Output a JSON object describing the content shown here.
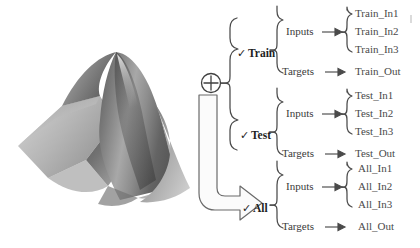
{
  "figure": {
    "caption": "",
    "surface_plot": {
      "name": "peaks-surface-3d",
      "colormap": "grayscale",
      "description": "Shaded 3D peaks surface"
    }
  },
  "combiner": {
    "icon": "circle-plus-icon",
    "symbol": "+"
  },
  "flow_arrow": {
    "icon": "hollow-bent-arrow-icon",
    "direction": "down-then-right"
  },
  "groups": [
    {
      "id": "train",
      "check": "✓",
      "label": "Train",
      "rows": [
        {
          "role": "Inputs",
          "arrow": "→",
          "values": [
            "Train_In1",
            "Train_In2",
            "Train_In3"
          ]
        },
        {
          "role": "Targets",
          "arrow": "→",
          "values": [
            "Train_Out"
          ]
        }
      ]
    },
    {
      "id": "test",
      "check": "✓",
      "label": "Test",
      "rows": [
        {
          "role": "Inputs",
          "arrow": "→",
          "values": [
            "Test_In1",
            "Test_In2",
            "Test_In3"
          ]
        },
        {
          "role": "Targets",
          "arrow": "→",
          "values": [
            "Test_Out"
          ]
        }
      ]
    },
    {
      "id": "all",
      "check": "✓",
      "label": "All",
      "rows": [
        {
          "role": "Inputs",
          "arrow": "→",
          "values": [
            "All_In1",
            "All_In2",
            "All_In3"
          ]
        },
        {
          "role": "Targets",
          "arrow": "→",
          "values": [
            "All_Out"
          ]
        }
      ]
    }
  ],
  "colors": {
    "ink": "#3a3a3a",
    "ink_dark": "#1f1f1f",
    "leaf": "#4a4a4a",
    "surface_light": "#d8d8d8",
    "surface_mid": "#9a9a9a",
    "surface_dark": "#4e4e4e",
    "background": "#ffffff"
  }
}
